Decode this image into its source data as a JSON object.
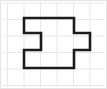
{
  "figure": {
    "canvas": {
      "width": 107,
      "height": 89
    },
    "background_color": "#ffffff",
    "border": {
      "color": "#e4e4e4",
      "width": 1,
      "x": 0.5,
      "y": 0.5,
      "w": 106,
      "h": 88
    },
    "grid": {
      "visible": true,
      "line_color": "#e8e8e8",
      "line_width": 1,
      "cell_size": 16.5,
      "x_lines": [
        7.5,
        24,
        40.5,
        57,
        73.5,
        90
      ],
      "y_lines": [
        3,
        19.5,
        36,
        52.5,
        69,
        85.5
      ]
    },
    "polygon": {
      "name": "notched-tab-polygon",
      "stroke_color": "#1c1c1c",
      "stroke_width": 2.6,
      "fill": "none",
      "line_join": "miter",
      "points": [
        [
          24,
          18
        ],
        [
          74,
          18
        ],
        [
          74,
          33
        ],
        [
          90,
          33
        ],
        [
          90,
          50
        ],
        [
          74,
          50
        ],
        [
          74,
          68
        ],
        [
          24,
          68
        ],
        [
          24,
          50
        ],
        [
          41,
          50
        ],
        [
          41,
          33
        ],
        [
          24,
          33
        ]
      ],
      "points_attr": "24,18 74,18 74,33 90,33 90,50 74,50 74,68 24,68 24,50 41,50 41,33 24,33",
      "vertex_count": 12
    }
  }
}
